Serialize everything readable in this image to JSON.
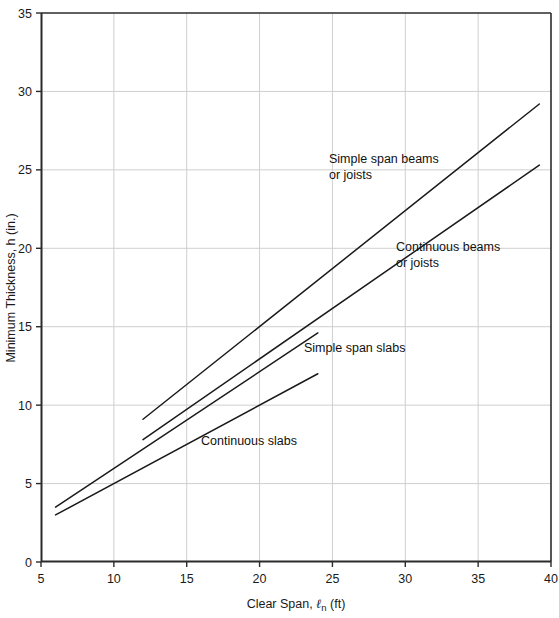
{
  "chart_data": {
    "type": "line",
    "title": "",
    "xlabel": "Clear Span, ℓn (ft)",
    "ylabel": "Minimum Thickness, h (in.)",
    "xlim": [
      5,
      40
    ],
    "ylim": [
      0,
      35
    ],
    "xticks": [
      5,
      10,
      15,
      20,
      25,
      30,
      35,
      40
    ],
    "yticks": [
      0,
      5,
      10,
      15,
      20,
      25,
      30,
      35
    ],
    "grid": true,
    "grid_color": "#cfcfcf",
    "line_color": "#1a1a1a",
    "legend": "none (inline annotations)",
    "series": [
      {
        "name": "Simple span beams or joists",
        "points": [
          [
            12,
            9.1
          ],
          [
            39.2,
            29.2
          ]
        ]
      },
      {
        "name": "Continuous beams or joists",
        "points": [
          [
            12,
            7.8
          ],
          [
            39.2,
            25.3
          ]
        ]
      },
      {
        "name": "Simple span slabs",
        "points": [
          [
            6,
            3.5
          ],
          [
            24,
            14.6
          ]
        ]
      },
      {
        "name": "Continuous slabs",
        "points": [
          [
            6,
            3.0
          ],
          [
            24,
            12.0
          ]
        ]
      }
    ],
    "annotations": [
      {
        "id": "annot-simple-span-beams",
        "lines": [
          "Simple span beams",
          "or joists"
        ],
        "x": 20.4,
        "y": 24.0
      },
      {
        "id": "annot-continuous-beams",
        "lines": [
          "Continuous beams",
          "or joists"
        ],
        "x": 25.0,
        "y": 18.4
      },
      {
        "id": "annot-simple-span-slabs",
        "lines": [
          "Simple span slabs"
        ],
        "x": 20.6,
        "y": 13.2
      },
      {
        "id": "annot-continuous-slabs",
        "lines": [
          "Continuous slabs"
        ],
        "x": 15.3,
        "y": 7.3
      }
    ]
  },
  "axes": {
    "x_tick_labels": [
      "5",
      "10",
      "15",
      "20",
      "25",
      "30",
      "35",
      "40"
    ],
    "y_tick_labels": [
      "0",
      "5",
      "10",
      "15",
      "20",
      "25",
      "30",
      "35"
    ],
    "x_axis_title_main": "Clear Span, ",
    "x_axis_title_symbol": "ℓ",
    "x_axis_title_sub": "n",
    "x_axis_title_unit": " (ft)",
    "y_axis_title": "Minimum Thickness, h (in.)"
  },
  "annotation_text": {
    "simple_span_beams_l1": "Simple span beams",
    "simple_span_beams_l2": "or joists",
    "continuous_beams_l1": "Continuous beams",
    "continuous_beams_l2": "or joists",
    "simple_span_slabs": "Simple span slabs",
    "continuous_slabs": "Continuous slabs"
  },
  "header": {
    "caption_strip": ""
  }
}
